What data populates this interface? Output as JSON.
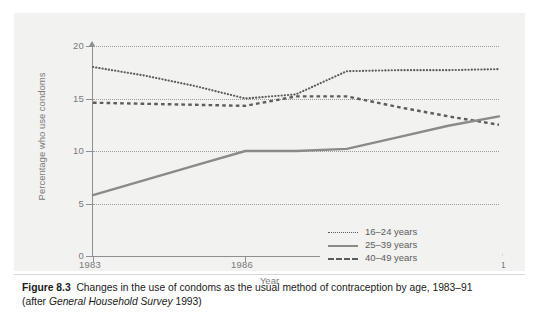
{
  "figure": {
    "number": "Figure 8.3",
    "caption_main": "Changes in the use of condoms as the usual method of contraception by age, 1983–91",
    "caption_source_prefix": "(after ",
    "caption_source_italic": "General Household Survey",
    "caption_source_suffix": " 1993)"
  },
  "chart_data": {
    "type": "line",
    "title": "",
    "xlabel": "Year",
    "ylabel": "Percentage who use condoms",
    "xlim": [
      1983,
      1991
    ],
    "ylim": [
      0,
      20
    ],
    "yticks": [
      0,
      5,
      10,
      15,
      20
    ],
    "xticks": [
      1983,
      1986,
      1988,
      1991
    ],
    "xtick_labels": [
      "1983",
      "1986",
      "1988",
      "1991"
    ],
    "ytick_labels": [
      "0",
      "5",
      "10",
      "15",
      "20"
    ],
    "grid": "horizontal-dotted",
    "legend_position": "bottom-right",
    "x": [
      1983,
      1984,
      1985,
      1986,
      1987,
      1988,
      1989,
      1990,
      1991
    ],
    "series": [
      {
        "name": "16–24 years",
        "style": "dotted",
        "color": "#5c5c5c",
        "values": [
          18.0,
          17.2,
          16.2,
          15.0,
          15.4,
          17.6,
          17.7,
          17.7,
          17.8
        ]
      },
      {
        "name": "25–39 years",
        "style": "solid",
        "color": "#8a8a8a",
        "values": [
          5.8,
          7.2,
          8.6,
          10.0,
          10.0,
          10.2,
          11.3,
          12.4,
          13.3
        ]
      },
      {
        "name": "40–49 years",
        "style": "dashed",
        "color": "#5c5c5c",
        "values": [
          14.6,
          14.5,
          14.4,
          14.3,
          15.2,
          15.2,
          14.2,
          13.3,
          12.5
        ]
      }
    ]
  },
  "legend": {
    "items": [
      {
        "label": "16–24 years",
        "style": "dotted"
      },
      {
        "label": "25–39 years",
        "style": "solid"
      },
      {
        "label": "40–49 years",
        "style": "dashed"
      }
    ]
  }
}
